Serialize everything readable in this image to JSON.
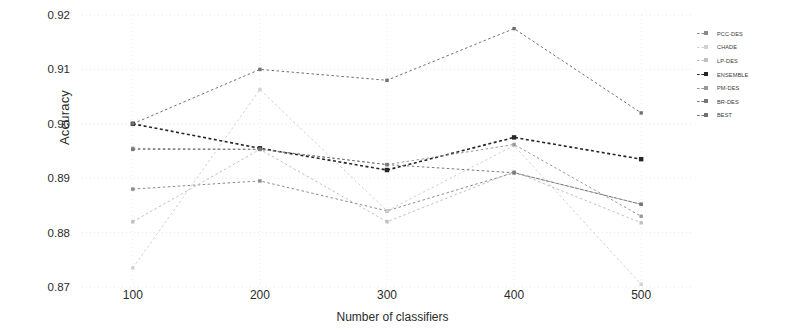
{
  "chart_data": {
    "type": "line",
    "title": "",
    "xlabel": "Number of classifiers",
    "ylabel": "Accuracy",
    "categories": [
      100,
      200,
      300,
      400,
      500
    ],
    "x": [
      100,
      200,
      300,
      400,
      500
    ],
    "xlim": [
      60,
      540
    ],
    "ylim": [
      0.87,
      0.92
    ],
    "yticks": [
      "0.92",
      "0.91",
      "0.90",
      "0.89",
      "0.88",
      "0.87"
    ],
    "ytick_values": [
      0.92,
      0.91,
      0.9,
      0.89,
      0.88,
      0.87
    ],
    "xticks": [
      "100",
      "200",
      "300",
      "400",
      "500"
    ],
    "grid": true,
    "legend_position": "right",
    "linestyle": "dashed",
    "marker": "square",
    "series": [
      {
        "name": "PCC-DES",
        "color": "#8a8a8a",
        "values": [
          0.888,
          0.8895,
          0.884,
          0.891,
          0.8852
        ]
      },
      {
        "name": "CHADE",
        "color": "#d2d2d2",
        "values": [
          0.8735,
          0.9063,
          0.884,
          0.896,
          0.8705
        ]
      },
      {
        "name": "LP-DES",
        "color": "#c0c0c0",
        "values": [
          0.882,
          0.8953,
          0.882,
          0.8912,
          0.8818
        ]
      },
      {
        "name": "ENSEMBLE",
        "color": "#252525",
        "values": [
          0.9,
          0.8955,
          0.8915,
          0.8975,
          0.8935
        ]
      },
      {
        "name": "PM-DES",
        "color": "#999999",
        "values": [
          0.8955,
          0.8953,
          0.8925,
          0.8962,
          0.883
        ]
      },
      {
        "name": "BR-DES",
        "color": "#777777",
        "values": [
          0.8953,
          0.8953,
          0.8925,
          0.891,
          0.8852
        ]
      },
      {
        "name": "BEST",
        "color": "#707070",
        "values": [
          0.9,
          0.91,
          0.908,
          0.9175,
          0.902
        ]
      }
    ]
  },
  "axes": {
    "ylabel": "Accuracy",
    "xlabel": "Number of classifiers"
  }
}
